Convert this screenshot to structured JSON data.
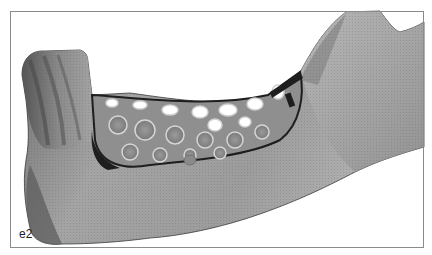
{
  "figure": {
    "panel_label": "e2",
    "colors": {
      "frame": "#8a8a8a",
      "bone_light": "#b8b8b8",
      "bone_mid": "#8e8e8e",
      "bone_dark": "#4a4a4a",
      "lattice_light": "#d6d6d6",
      "lattice_dark": "#1e1e1e",
      "background": "#ffffff"
    }
  }
}
